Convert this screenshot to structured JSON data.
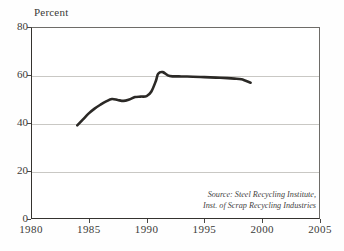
{
  "chart_data": {
    "type": "line",
    "title": "",
    "subtitle": "",
    "xlabel": "",
    "ylabel": "Percent",
    "xlim": [
      1980,
      2005
    ],
    "ylim": [
      0,
      80
    ],
    "xticks": [
      "1980",
      "1985",
      "1990",
      "1995",
      "2000",
      "2005"
    ],
    "yticks": [
      "0",
      "20",
      "40",
      "60",
      "80"
    ],
    "grid": "horizontal",
    "legend": "none",
    "series": [
      {
        "name": "Steel recycling rate",
        "x": [
          1984,
          1984.5,
          1985,
          1985.5,
          1986,
          1986.5,
          1987,
          1987.5,
          1988,
          1988.5,
          1989,
          1989.5,
          1990,
          1990.4,
          1990.8,
          1991,
          1991.4,
          1992,
          1993,
          1994,
          1995,
          1996,
          1997,
          1997.6,
          1998.2,
          1999
        ],
        "values": [
          39,
          41.5,
          44,
          46,
          47.6,
          49,
          50,
          49.6,
          49.2,
          49.8,
          50.8,
          51,
          51.2,
          53,
          57.5,
          60.5,
          61.2,
          59.6,
          59.4,
          59.3,
          59.1,
          58.9,
          58.7,
          58.5,
          58.2,
          56.8
        ]
      }
    ],
    "annotations": {
      "source_line_1": "Source: Steel Recycling Institute,",
      "source_line_2": "Inst. of Scrap Recycling Industries"
    },
    "colors": {
      "line": "#2b2926",
      "grid": "#c9c8c4",
      "axis": "#35332f",
      "text": "#3a3a38",
      "background": "#ffffff"
    }
  }
}
